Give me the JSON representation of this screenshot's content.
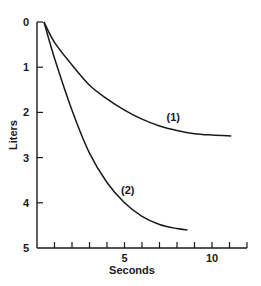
{
  "chart_data": {
    "type": "line",
    "title": "",
    "xlabel": "Seconds",
    "ylabel": "Liters",
    "xlim": [
      0,
      12
    ],
    "ylim": [
      5,
      0
    ],
    "y_inverted": true,
    "x_ticks": [
      0,
      1,
      2,
      3,
      4,
      5,
      6,
      7,
      8,
      9,
      10,
      11,
      12
    ],
    "x_tick_labels": {
      "5": "5",
      "10": "10"
    },
    "y_ticks": [
      0,
      1,
      2,
      3,
      4,
      5
    ],
    "y_tick_labels": [
      "0",
      "1",
      "2",
      "3",
      "4",
      "5"
    ],
    "grid": false,
    "legend": "none (inline labels)",
    "series": [
      {
        "name": "(1)",
        "x": [
          0.4,
          1,
          2,
          3,
          4,
          5,
          6,
          7,
          8,
          9,
          10,
          11.1
        ],
        "y": [
          0,
          0.45,
          0.95,
          1.4,
          1.7,
          1.95,
          2.15,
          2.3,
          2.4,
          2.47,
          2.5,
          2.52
        ]
      },
      {
        "name": "(2)",
        "x": [
          0.4,
          1,
          2,
          3,
          4,
          5,
          6,
          7,
          8,
          8.6
        ],
        "y": [
          0,
          0.8,
          1.95,
          2.9,
          3.55,
          4.0,
          4.3,
          4.48,
          4.57,
          4.6
        ]
      }
    ],
    "annotations": [
      {
        "text": "(1)",
        "x": 7.4,
        "y": 2.2
      },
      {
        "text": "(2)",
        "x": 4.8,
        "y": 3.8
      }
    ]
  }
}
